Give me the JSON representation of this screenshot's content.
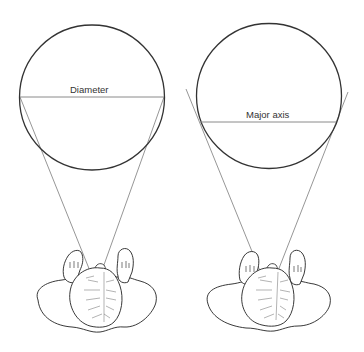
{
  "diagram": {
    "panels": [
      {
        "id": "left",
        "label": "Diameter",
        "description": "Circle viewed straight on; lines of sight tangent at the diameter endpoints"
      },
      {
        "id": "right",
        "label": "Major axis",
        "description": "Circle viewed obliquely; lines of sight tangent below the center along the major axis"
      }
    ],
    "colors": {
      "circle_stroke": "#333333",
      "line_stroke": "#8a8a8a",
      "figure_stroke": "#222222",
      "label_text": "#333333"
    }
  }
}
